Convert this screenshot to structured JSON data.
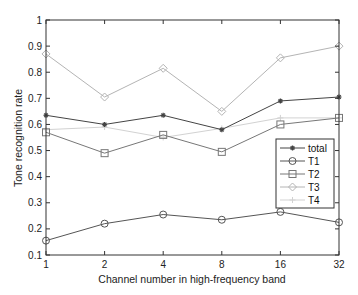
{
  "chart_data": {
    "type": "line",
    "title": "",
    "xlabel": "Channel number in high-frequency band",
    "ylabel": "Tone recognition rate",
    "x": [
      "1",
      "2",
      "4",
      "8",
      "16",
      "32"
    ],
    "categories": [
      "1",
      "2",
      "4",
      "8",
      "16",
      "32"
    ],
    "ylim": [
      0.1,
      1.0
    ],
    "yticks": [
      "0.1",
      "0.2",
      "0.3",
      "0.4",
      "0.5",
      "0.6",
      "0.7",
      "0.8",
      "0.9",
      "1"
    ],
    "grid": false,
    "legend_position": "inside right",
    "series": [
      {
        "name": "total",
        "marker": "asterisk",
        "color": "#444444",
        "values": [
          0.635,
          0.6,
          0.635,
          0.58,
          0.69,
          0.705
        ]
      },
      {
        "name": "T1",
        "marker": "circle",
        "color": "#555555",
        "values": [
          0.155,
          0.22,
          0.255,
          0.235,
          0.265,
          0.225
        ]
      },
      {
        "name": "T2",
        "marker": "square",
        "color": "#777777",
        "values": [
          0.57,
          0.49,
          0.56,
          0.495,
          0.6,
          0.625
        ]
      },
      {
        "name": "T3",
        "marker": "diamond",
        "color": "#b4b4b4",
        "values": [
          0.87,
          0.705,
          0.815,
          0.65,
          0.855,
          0.9
        ]
      },
      {
        "name": "T4",
        "marker": "plus",
        "color": "#d2d2d2",
        "values": [
          0.58,
          0.59,
          0.55,
          0.585,
          0.625,
          0.625
        ]
      }
    ]
  }
}
